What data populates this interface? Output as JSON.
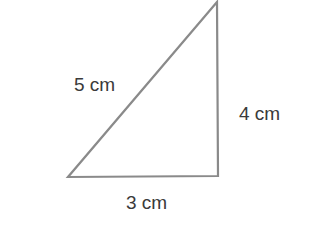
{
  "diagram": {
    "type": "right-triangle",
    "stroke_color": "#8a8a8a",
    "text_color": "#3a3a3a",
    "vertices": {
      "top": [
        217,
        2
      ],
      "bottom_left": [
        68,
        177
      ],
      "bottom_right": [
        218,
        176
      ]
    },
    "labels": {
      "hypotenuse": "5 cm",
      "vertical_side": "4 cm",
      "base": "3 cm"
    }
  }
}
